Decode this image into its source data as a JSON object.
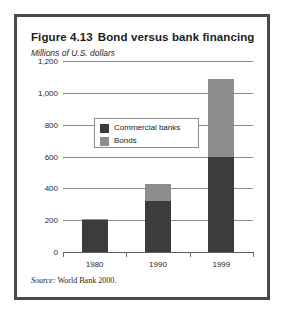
{
  "figure": {
    "number": "Figure 4.13",
    "title": "Bond versus bank financing",
    "subtitle": "Millions of U.S. dollars",
    "source_word": "Source:",
    "source_text": "World Bank 2000."
  },
  "colors": {
    "commercial_banks": "#3c3c3c",
    "bonds": "#8d8d8d",
    "gridline": "#8d8d8d",
    "frame": "#4a4a4a",
    "background": "#ffffff",
    "text": "#1c1c1c"
  },
  "chart_data": {
    "type": "bar",
    "stacked": true,
    "subtitle": "Millions of U.S. dollars",
    "xlabel": "",
    "ylabel": "Millions of U.S. dollars",
    "categories": [
      "1980",
      "1990",
      "1999"
    ],
    "series": [
      {
        "name": "Commercial banks",
        "values": [
          200,
          320,
          600
        ],
        "color": "#3c3c3c"
      },
      {
        "name": "Bonds",
        "values": [
          10,
          110,
          490
        ],
        "color": "#8d8d8d"
      }
    ],
    "totals": [
      210,
      430,
      1090
    ],
    "ylim": [
      0,
      1200
    ],
    "yticks": [
      0,
      200,
      400,
      600,
      800,
      1000,
      1200
    ],
    "ytick_labels": [
      "0",
      "200",
      "400",
      "600",
      "800",
      "1,000",
      "1,200"
    ],
    "grid": true,
    "legend_position": "inside-upper-left",
    "source": "Source: World Bank 2000."
  },
  "legend": {
    "items": [
      {
        "label": "Commercial banks",
        "color": "#3c3c3c"
      },
      {
        "label": "Bonds",
        "color": "#8d8d8d"
      }
    ]
  }
}
